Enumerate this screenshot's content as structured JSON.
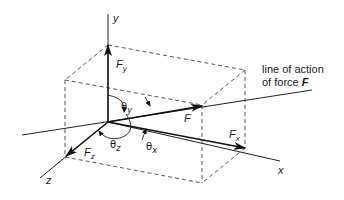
{
  "diagram": {
    "colors": {
      "line": "#222222",
      "dashed": "#444444",
      "background": "#ffffff"
    },
    "axes": {
      "x": {
        "label": "x"
      },
      "y": {
        "label": "y"
      },
      "z": {
        "label": "z"
      }
    },
    "vectors": {
      "F": {
        "label": "F"
      },
      "Fx": {
        "base": "F",
        "sub": "x"
      },
      "Fy": {
        "base": "F",
        "sub": "y"
      },
      "Fz": {
        "base": "F",
        "sub": "z"
      }
    },
    "angles": {
      "theta_x": {
        "base": "θ",
        "sub": "x"
      },
      "theta_y": {
        "base": "θ",
        "sub": "y"
      },
      "theta_z": {
        "base": "θ",
        "sub": "z"
      }
    },
    "annotation": {
      "line1": "line of action",
      "line2_prefix": "of force ",
      "line2_var": "F"
    }
  }
}
